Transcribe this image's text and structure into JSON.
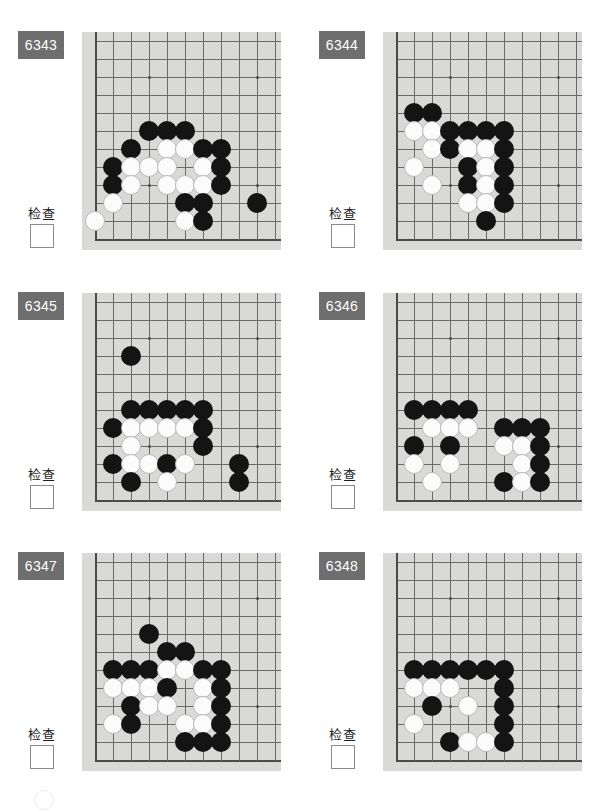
{
  "page": {
    "background_color": "#ffffff",
    "board_color": "#d9d9d7",
    "badge_color": "#6e6e6e",
    "black_stone_color": "#141414",
    "white_stone_color": "#fbfbfb",
    "grid_line_color": "#6a6a6a",
    "columns": 2,
    "rows": 3
  },
  "board_geometry": {
    "cols": 11,
    "rows": 12,
    "cell": 18,
    "origin_x": 13,
    "origin_y": 9,
    "left_edge_col": 0,
    "bottom_edge_row": 11,
    "star_points": [
      [
        3,
        2
      ],
      [
        9,
        2
      ],
      [
        3,
        8
      ],
      [
        9,
        8
      ]
    ]
  },
  "labels": {
    "check_text": "检查"
  },
  "problems": [
    {
      "id": "6343",
      "number": "6343",
      "check_label": "检查",
      "checkbox_checked": false,
      "stones": [
        {
          "c": 3,
          "r": 5,
          "color": "black"
        },
        {
          "c": 4,
          "r": 5,
          "color": "black"
        },
        {
          "c": 5,
          "r": 5,
          "color": "black"
        },
        {
          "c": 2,
          "r": 6,
          "color": "black"
        },
        {
          "c": 4,
          "r": 6,
          "color": "white"
        },
        {
          "c": 5,
          "r": 6,
          "color": "white"
        },
        {
          "c": 6,
          "r": 6,
          "color": "black"
        },
        {
          "c": 7,
          "r": 6,
          "color": "black"
        },
        {
          "c": 1,
          "r": 7,
          "color": "black"
        },
        {
          "c": 2,
          "r": 7,
          "color": "white"
        },
        {
          "c": 3,
          "r": 7,
          "color": "white"
        },
        {
          "c": 4,
          "r": 7,
          "color": "white"
        },
        {
          "c": 6,
          "r": 7,
          "color": "white"
        },
        {
          "c": 7,
          "r": 7,
          "color": "black"
        },
        {
          "c": 1,
          "r": 8,
          "color": "black"
        },
        {
          "c": 2,
          "r": 8,
          "color": "white"
        },
        {
          "c": 4,
          "r": 8,
          "color": "white"
        },
        {
          "c": 5,
          "r": 8,
          "color": "white"
        },
        {
          "c": 6,
          "r": 8,
          "color": "white"
        },
        {
          "c": 7,
          "r": 8,
          "color": "black"
        },
        {
          "c": 1,
          "r": 9,
          "color": "white"
        },
        {
          "c": 5,
          "r": 9,
          "color": "black"
        },
        {
          "c": 6,
          "r": 9,
          "color": "black"
        },
        {
          "c": 9,
          "r": 9,
          "color": "black"
        },
        {
          "c": 0,
          "r": 10,
          "color": "white"
        },
        {
          "c": 5,
          "r": 10,
          "color": "white"
        },
        {
          "c": 6,
          "r": 10,
          "color": "black"
        }
      ]
    },
    {
      "id": "6344",
      "number": "6344",
      "check_label": "检查",
      "checkbox_checked": false,
      "stones": [
        {
          "c": 1,
          "r": 4,
          "color": "black"
        },
        {
          "c": 2,
          "r": 4,
          "color": "black"
        },
        {
          "c": 1,
          "r": 5,
          "color": "white"
        },
        {
          "c": 2,
          "r": 5,
          "color": "white"
        },
        {
          "c": 3,
          "r": 5,
          "color": "black"
        },
        {
          "c": 4,
          "r": 5,
          "color": "black"
        },
        {
          "c": 5,
          "r": 5,
          "color": "black"
        },
        {
          "c": 6,
          "r": 5,
          "color": "black"
        },
        {
          "c": 2,
          "r": 6,
          "color": "white"
        },
        {
          "c": 3,
          "r": 6,
          "color": "black"
        },
        {
          "c": 4,
          "r": 6,
          "color": "white"
        },
        {
          "c": 5,
          "r": 6,
          "color": "white"
        },
        {
          "c": 6,
          "r": 6,
          "color": "black"
        },
        {
          "c": 1,
          "r": 7,
          "color": "white"
        },
        {
          "c": 4,
          "r": 7,
          "color": "black"
        },
        {
          "c": 5,
          "r": 7,
          "color": "white"
        },
        {
          "c": 6,
          "r": 7,
          "color": "black"
        },
        {
          "c": 2,
          "r": 8,
          "color": "white"
        },
        {
          "c": 4,
          "r": 8,
          "color": "black"
        },
        {
          "c": 5,
          "r": 8,
          "color": "white"
        },
        {
          "c": 6,
          "r": 8,
          "color": "black"
        },
        {
          "c": 4,
          "r": 9,
          "color": "white"
        },
        {
          "c": 5,
          "r": 9,
          "color": "white"
        },
        {
          "c": 6,
          "r": 9,
          "color": "black"
        },
        {
          "c": 5,
          "r": 10,
          "color": "black"
        }
      ]
    },
    {
      "id": "6345",
      "number": "6345",
      "check_label": "检查",
      "checkbox_checked": false,
      "stones": [
        {
          "c": 2,
          "r": 3,
          "color": "black"
        },
        {
          "c": 2,
          "r": 6,
          "color": "black"
        },
        {
          "c": 3,
          "r": 6,
          "color": "black"
        },
        {
          "c": 4,
          "r": 6,
          "color": "black"
        },
        {
          "c": 5,
          "r": 6,
          "color": "black"
        },
        {
          "c": 6,
          "r": 6,
          "color": "black"
        },
        {
          "c": 1,
          "r": 7,
          "color": "black"
        },
        {
          "c": 2,
          "r": 7,
          "color": "white"
        },
        {
          "c": 3,
          "r": 7,
          "color": "white"
        },
        {
          "c": 4,
          "r": 7,
          "color": "white"
        },
        {
          "c": 5,
          "r": 7,
          "color": "white"
        },
        {
          "c": 6,
          "r": 7,
          "color": "black"
        },
        {
          "c": 2,
          "r": 8,
          "color": "white"
        },
        {
          "c": 6,
          "r": 8,
          "color": "black"
        },
        {
          "c": 1,
          "r": 9,
          "color": "black"
        },
        {
          "c": 2,
          "r": 9,
          "color": "white"
        },
        {
          "c": 3,
          "r": 9,
          "color": "white"
        },
        {
          "c": 4,
          "r": 9,
          "color": "black"
        },
        {
          "c": 5,
          "r": 9,
          "color": "white"
        },
        {
          "c": 8,
          "r": 9,
          "color": "black"
        },
        {
          "c": 2,
          "r": 10,
          "color": "black"
        },
        {
          "c": 4,
          "r": 10,
          "color": "white"
        },
        {
          "c": 8,
          "r": 10,
          "color": "black"
        }
      ]
    },
    {
      "id": "6346",
      "number": "6346",
      "check_label": "检查",
      "checkbox_checked": false,
      "stones": [
        {
          "c": 1,
          "r": 6,
          "color": "black"
        },
        {
          "c": 2,
          "r": 6,
          "color": "black"
        },
        {
          "c": 3,
          "r": 6,
          "color": "black"
        },
        {
          "c": 4,
          "r": 6,
          "color": "black"
        },
        {
          "c": 2,
          "r": 7,
          "color": "white"
        },
        {
          "c": 3,
          "r": 7,
          "color": "white"
        },
        {
          "c": 4,
          "r": 7,
          "color": "white"
        },
        {
          "c": 6,
          "r": 7,
          "color": "black"
        },
        {
          "c": 7,
          "r": 7,
          "color": "black"
        },
        {
          "c": 8,
          "r": 7,
          "color": "black"
        },
        {
          "c": 1,
          "r": 8,
          "color": "black"
        },
        {
          "c": 3,
          "r": 8,
          "color": "black"
        },
        {
          "c": 6,
          "r": 8,
          "color": "white"
        },
        {
          "c": 7,
          "r": 8,
          "color": "white"
        },
        {
          "c": 8,
          "r": 8,
          "color": "black"
        },
        {
          "c": 1,
          "r": 9,
          "color": "white"
        },
        {
          "c": 3,
          "r": 9,
          "color": "white"
        },
        {
          "c": 7,
          "r": 9,
          "color": "white"
        },
        {
          "c": 8,
          "r": 9,
          "color": "black"
        },
        {
          "c": 2,
          "r": 10,
          "color": "white"
        },
        {
          "c": 6,
          "r": 10,
          "color": "black"
        },
        {
          "c": 7,
          "r": 10,
          "color": "white"
        },
        {
          "c": 8,
          "r": 10,
          "color": "black"
        }
      ]
    },
    {
      "id": "6347",
      "number": "6347",
      "check_label": "检查",
      "checkbox_checked": false,
      "stones": [
        {
          "c": 3,
          "r": 4,
          "color": "black"
        },
        {
          "c": 4,
          "r": 5,
          "color": "black"
        },
        {
          "c": 5,
          "r": 5,
          "color": "black"
        },
        {
          "c": 1,
          "r": 6,
          "color": "black"
        },
        {
          "c": 2,
          "r": 6,
          "color": "black"
        },
        {
          "c": 3,
          "r": 6,
          "color": "black"
        },
        {
          "c": 4,
          "r": 6,
          "color": "white"
        },
        {
          "c": 5,
          "r": 6,
          "color": "white"
        },
        {
          "c": 6,
          "r": 6,
          "color": "black"
        },
        {
          "c": 7,
          "r": 6,
          "color": "black"
        },
        {
          "c": 1,
          "r": 7,
          "color": "white"
        },
        {
          "c": 2,
          "r": 7,
          "color": "white"
        },
        {
          "c": 3,
          "r": 7,
          "color": "white"
        },
        {
          "c": 4,
          "r": 7,
          "color": "black"
        },
        {
          "c": 6,
          "r": 7,
          "color": "white"
        },
        {
          "c": 7,
          "r": 7,
          "color": "black"
        },
        {
          "c": 2,
          "r": 8,
          "color": "black"
        },
        {
          "c": 3,
          "r": 8,
          "color": "white"
        },
        {
          "c": 4,
          "r": 8,
          "color": "white"
        },
        {
          "c": 6,
          "r": 8,
          "color": "white"
        },
        {
          "c": 7,
          "r": 8,
          "color": "black"
        },
        {
          "c": 1,
          "r": 9,
          "color": "white"
        },
        {
          "c": 2,
          "r": 9,
          "color": "black"
        },
        {
          "c": 5,
          "r": 9,
          "color": "white"
        },
        {
          "c": 6,
          "r": 9,
          "color": "white"
        },
        {
          "c": 7,
          "r": 9,
          "color": "black"
        },
        {
          "c": 5,
          "r": 10,
          "color": "black"
        },
        {
          "c": 6,
          "r": 10,
          "color": "black"
        },
        {
          "c": 7,
          "r": 10,
          "color": "black"
        }
      ]
    },
    {
      "id": "6348",
      "number": "6348",
      "check_label": "检查",
      "checkbox_checked": false,
      "stones": [
        {
          "c": 1,
          "r": 6,
          "color": "black"
        },
        {
          "c": 2,
          "r": 6,
          "color": "black"
        },
        {
          "c": 3,
          "r": 6,
          "color": "black"
        },
        {
          "c": 4,
          "r": 6,
          "color": "black"
        },
        {
          "c": 5,
          "r": 6,
          "color": "black"
        },
        {
          "c": 6,
          "r": 6,
          "color": "black"
        },
        {
          "c": 1,
          "r": 7,
          "color": "white"
        },
        {
          "c": 2,
          "r": 7,
          "color": "white"
        },
        {
          "c": 3,
          "r": 7,
          "color": "white"
        },
        {
          "c": 6,
          "r": 7,
          "color": "black"
        },
        {
          "c": 2,
          "r": 8,
          "color": "black"
        },
        {
          "c": 4,
          "r": 8,
          "color": "white"
        },
        {
          "c": 6,
          "r": 8,
          "color": "black"
        },
        {
          "c": 1,
          "r": 9,
          "color": "white"
        },
        {
          "c": 6,
          "r": 9,
          "color": "black"
        },
        {
          "c": 3,
          "r": 10,
          "color": "black"
        },
        {
          "c": 4,
          "r": 10,
          "color": "white"
        },
        {
          "c": 5,
          "r": 10,
          "color": "white"
        },
        {
          "c": 6,
          "r": 10,
          "color": "black"
        }
      ]
    }
  ]
}
